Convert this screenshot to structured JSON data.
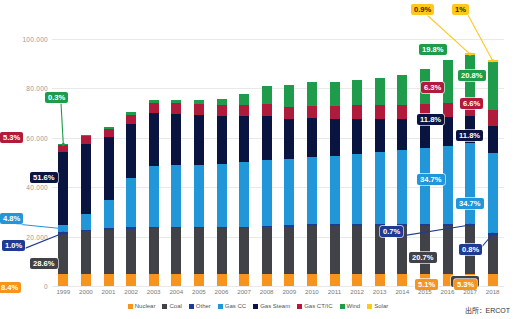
{
  "chart_data": {
    "type": "bar",
    "stacked": true,
    "title": "",
    "subtitle": "",
    "xlabel": "",
    "ylabel": "",
    "grid": true,
    "legend_position": "bottom",
    "ylim": [
      0,
      110000
    ],
    "yticks": [
      0,
      20000,
      40000,
      60000,
      80000,
      100000
    ],
    "ytick_labels": [
      "0",
      "20.000",
      "40.000",
      "60.000",
      "80.000",
      "100.000"
    ],
    "categories": [
      "1999",
      "2000",
      "2001",
      "2002",
      "2003",
      "2004",
      "2005",
      "2006",
      "2007",
      "2008",
      "2009",
      "2010",
      "2011",
      "2012",
      "2013",
      "2014",
      "2015",
      "2016",
      "2017",
      "2018"
    ],
    "series": [
      {
        "name": "Nuclear",
        "color": "#F7941E",
        "values": [
          4800,
          4800,
          4800,
          4800,
          4800,
          4800,
          4800,
          4800,
          4800,
          4800,
          4800,
          4800,
          4800,
          4800,
          4800,
          4800,
          4800,
          4800,
          4800,
          4800
        ]
      },
      {
        "name": "Coal",
        "color": "#404248",
        "values": [
          16400,
          17300,
          17900,
          18300,
          18600,
          18600,
          18600,
          18600,
          18600,
          19000,
          19200,
          19500,
          19500,
          19600,
          19600,
          19600,
          19600,
          19600,
          19500,
          15800
        ]
      },
      {
        "name": "Other",
        "color": "#1F3A93",
        "values": [
          570,
          570,
          570,
          570,
          580,
          580,
          600,
          600,
          620,
          640,
          640,
          650,
          650,
          660,
          660,
          660,
          660,
          660,
          660,
          750
        ]
      },
      {
        "name": "Gas CC",
        "color": "#2196D8",
        "values": [
          2750,
          6300,
          11500,
          19900,
          24600,
          24800,
          25000,
          25200,
          26100,
          26400,
          26600,
          27100,
          27600,
          28200,
          29000,
          29900,
          30900,
          31700,
          32700,
          32500
        ]
      },
      {
        "name": "Gas Steam",
        "color": "#0A1440",
        "values": [
          29600,
          28600,
          25400,
          22100,
          21400,
          20900,
          20200,
          19400,
          18500,
          17900,
          16200,
          15800,
          15000,
          14300,
          13400,
          12400,
          11800,
          11400,
          11100,
          11050
        ]
      },
      {
        "name": "Gas CT/IC",
        "color": "#B01B3B",
        "values": [
          3040,
          3100,
          3200,
          3600,
          4100,
          4200,
          4350,
          4500,
          4700,
          4900,
          5000,
          5100,
          5300,
          5450,
          5600,
          5750,
          5850,
          5950,
          5950,
          6200
        ]
      },
      {
        "name": "Wind",
        "color": "#1E9B4B",
        "values": [
          170,
          180,
          950,
          1100,
          1200,
          1300,
          1700,
          2700,
          4400,
          7100,
          8900,
          9400,
          9500,
          10400,
          11000,
          12300,
          14100,
          17100,
          18650,
          19500
        ]
      },
      {
        "name": "Solar",
        "color": "#FFC81F",
        "values": [
          0,
          0,
          0,
          0,
          0,
          0,
          0,
          0,
          0,
          0,
          0,
          0,
          0,
          0,
          0,
          0,
          0,
          0,
          850,
          940
        ]
      }
    ],
    "totals": [
      57330,
      60850,
      64320,
      70370,
      75280,
      75180,
      75250,
      75800,
      77720,
      80740,
      81340,
      82350,
      82350,
      83410,
      84060,
      85410,
      87710,
      91210,
      94210,
      91540
    ],
    "annotations": [
      {
        "id": "a-1999-solar-wind",
        "year": "1999",
        "series": "Wind",
        "text": "0.3%",
        "color": "#1E9B4B"
      },
      {
        "id": "a-1999-ctic",
        "year": "1999",
        "series": "Gas CT/IC",
        "text": "5.3%",
        "color": "#B01B3B"
      },
      {
        "id": "a-1999-steam",
        "year": "1999",
        "series": "Gas Steam",
        "text": "51.6%",
        "color": "#0A1440"
      },
      {
        "id": "a-1999-gascc",
        "year": "1999",
        "series": "Gas CC",
        "text": "4.8%",
        "color": "#2196D8"
      },
      {
        "id": "a-1999-other",
        "year": "1999",
        "series": "Other",
        "text": "1.0%",
        "color": "#1F3A93"
      },
      {
        "id": "a-1999-coal",
        "year": "1999",
        "series": "Coal",
        "text": "28.6%",
        "color": "#404248"
      },
      {
        "id": "a-1999-nuclear",
        "year": "1999",
        "series": "Nuclear",
        "text": "8.4%",
        "color": "#F7941E"
      },
      {
        "id": "a-2017-solar",
        "year": "2017",
        "series": "Solar",
        "text": "0.9%",
        "color": "#FFC81F"
      },
      {
        "id": "a-2018-solar",
        "year": "2018",
        "series": "Solar",
        "text": "1%",
        "color": "#FFC81F"
      },
      {
        "id": "a-2017-wind",
        "year": "2017",
        "series": "Wind",
        "text": "19.8%",
        "color": "#1E9B4B"
      },
      {
        "id": "a-2018-wind",
        "year": "2018",
        "series": "Wind",
        "text": "20.8%",
        "color": "#1E9B4B"
      },
      {
        "id": "a-2017-ctic",
        "year": "2017",
        "series": "Gas CT/IC",
        "text": "6.3%",
        "color": "#B01B3B"
      },
      {
        "id": "a-2018-ctic",
        "year": "2018",
        "series": "Gas CT/IC",
        "text": "6.6%",
        "color": "#B01B3B"
      },
      {
        "id": "a-2017-steam",
        "year": "2017",
        "series": "Gas Steam",
        "text": "11.8%",
        "color": "#0A1440"
      },
      {
        "id": "a-2018-steam",
        "year": "2018",
        "series": "Gas Steam",
        "text": "11.8%",
        "color": "#0A1440"
      },
      {
        "id": "a-2017-gascc",
        "year": "2017",
        "series": "Gas CC",
        "text": "34.7%",
        "color": "#2196D8"
      },
      {
        "id": "a-2018-gascc",
        "year": "2018",
        "series": "Gas CC",
        "text": "34.7%",
        "color": "#2196D8"
      },
      {
        "id": "a-2017-other",
        "year": "2017",
        "series": "Other",
        "text": "0.7%",
        "color": "#1F3A93"
      },
      {
        "id": "a-2018-other",
        "year": "2018",
        "series": "Other",
        "text": "0.8%",
        "color": "#1F3A93"
      },
      {
        "id": "a-2017-coal",
        "year": "2017",
        "series": "Coal",
        "text": "20.7%",
        "color": "#404248"
      },
      {
        "id": "a-2018-coal",
        "year": "2018",
        "series": "Coal",
        "text": "16.9%",
        "color": "#404248"
      },
      {
        "id": "a-2017-nuclear",
        "year": "2017",
        "series": "Nuclear",
        "text": "5.1%",
        "color": "#F7941E"
      },
      {
        "id": "a-2018-nuclear",
        "year": "2018",
        "series": "Nuclear",
        "text": "5.3%",
        "color": "#F7941E"
      }
    ]
  },
  "footer": {
    "source": "出所：ERCOT"
  }
}
